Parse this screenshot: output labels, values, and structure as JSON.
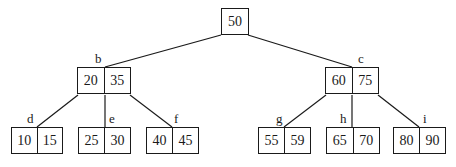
{
  "diagram": {
    "type": "B-tree (2-3 tree)",
    "root": {
      "keys": [
        "50"
      ],
      "label": ""
    },
    "internal": [
      {
        "id": "b",
        "label": "b",
        "keys": [
          "20",
          "35"
        ]
      },
      {
        "id": "c",
        "label": "c",
        "keys": [
          "60",
          "75"
        ]
      }
    ],
    "leaves": [
      {
        "id": "d",
        "label": "d",
        "keys": [
          "10",
          "15"
        ]
      },
      {
        "id": "e",
        "label": "e",
        "keys": [
          "25",
          "30"
        ]
      },
      {
        "id": "f",
        "label": "f",
        "keys": [
          "40",
          "45"
        ]
      },
      {
        "id": "g",
        "label": "g",
        "keys": [
          "55",
          "59"
        ]
      },
      {
        "id": "h",
        "label": "h",
        "keys": [
          "65",
          "70"
        ]
      },
      {
        "id": "i",
        "label": "i",
        "keys": [
          "80",
          "90"
        ]
      }
    ],
    "edges": [
      [
        "root",
        "b"
      ],
      [
        "root",
        "c"
      ],
      [
        "b",
        "d"
      ],
      [
        "b",
        "e"
      ],
      [
        "b",
        "f"
      ],
      [
        "c",
        "g"
      ],
      [
        "c",
        "h"
      ],
      [
        "c",
        "i"
      ]
    ],
    "colors": {
      "stroke": "#1a1a1a",
      "background": "#ffffff"
    }
  }
}
